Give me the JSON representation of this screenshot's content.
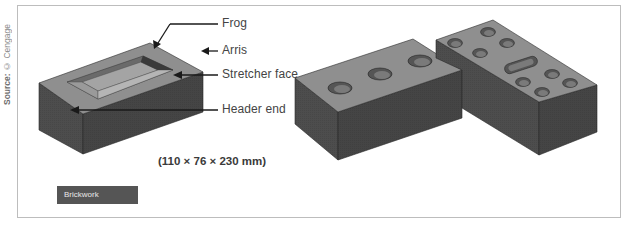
{
  "source_credit": {
    "prefix": "Source:",
    "text": " © Cengage"
  },
  "labels": {
    "frog": "Frog",
    "arris": "Arris",
    "stretcher_face": "Stretcher face",
    "header_end": "Header end"
  },
  "dimensions": "(110 × 76 × 230 mm)",
  "tag": "Brickwork",
  "colors": {
    "brick_top": "#8e8e8e",
    "brick_side": "#4a4a4a",
    "brick_front": "#3e3e3e",
    "tag_bg": "#555555",
    "frame_border": "#bdbdbd"
  }
}
